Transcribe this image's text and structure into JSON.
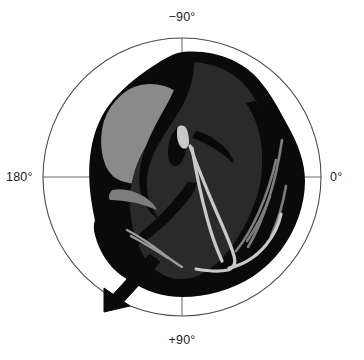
{
  "figure": {
    "name": "cardiac-short-axis-polar-diagram",
    "background_color": "#ffffff",
    "axis_line_color": "#6b6b6b",
    "circle_stroke_color": "#4a4a4a"
  },
  "polar_axes": {
    "center": {
      "x": 182,
      "y": 177
    },
    "radius": 139,
    "labels": {
      "top": "−90°",
      "right": "0°",
      "bottom": "+90°",
      "left": "180°"
    },
    "label_angles_deg": {
      "top": -90,
      "right": 0,
      "bottom": 90,
      "left": 180
    },
    "crosshair": true,
    "grid": false
  },
  "anatomy": {
    "myocardium_color": "#0a0a0a",
    "left_chamber_color": "#8a8a8a",
    "right_chamber_color": "#2a2a2a",
    "valve_color": "#c9c9c9",
    "parts": [
      {
        "name": "myocardium-wall",
        "fill": "#0a0a0a"
      },
      {
        "name": "left-ventricle-cavity",
        "fill": "#8a8a8a"
      },
      {
        "name": "right-ventricle-cavity",
        "fill": "#2a2a2a"
      },
      {
        "name": "papillary-muscle",
        "fill": "#0a0a0a"
      },
      {
        "name": "valve-leaflet-chordae",
        "fill": "#c9c9c9"
      },
      {
        "name": "trabeculae",
        "fill": "#7d7d7d"
      }
    ]
  },
  "annotation": {
    "arrow": {
      "name": "direction-arrow",
      "color": "#0a0a0a",
      "from": {
        "x": 148,
        "y": 258
      },
      "to": {
        "x": 104,
        "y": 311
      },
      "direction_deg": 130
    }
  }
}
